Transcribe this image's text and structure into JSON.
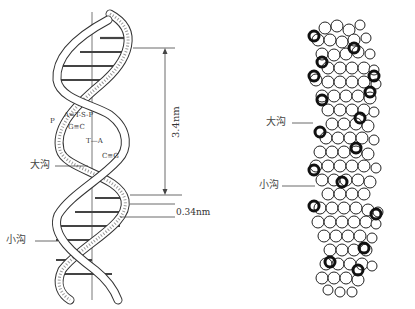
{
  "figure": {
    "left_diagram": {
      "title": "DNA double helix ribbon schematic",
      "labels": {
        "major_groove": "大沟",
        "minor_groove": "小沟",
        "helix_pitch": "3.4nm",
        "base_pair_spacing": "0.34nm"
      },
      "base_pairs": [
        {
          "left": "A",
          "bond": "=",
          "right": "T"
        },
        {
          "left": "G",
          "bond": "≡",
          "right": "C"
        },
        {
          "left": "T",
          "bond": "—",
          "right": "A"
        },
        {
          "left": "C",
          "bond": "≡",
          "right": "G"
        }
      ],
      "backbone_symbols": {
        "sugar": "S",
        "phosphate": "P"
      }
    },
    "right_diagram": {
      "title": "DNA space-filling model",
      "labels": {
        "major_groove": "大沟",
        "minor_groove": "小沟"
      }
    },
    "colors": {
      "line": "#333333",
      "background": "#ffffff",
      "atom_dark": "#111111"
    }
  }
}
